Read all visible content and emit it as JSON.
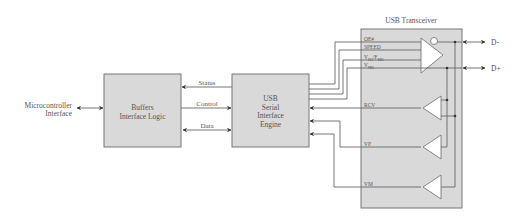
{
  "diagram": {
    "title": "USB Transceiver",
    "blocks": {
      "microcontroller": {
        "line1": "Microcontroller",
        "line2": "Interface"
      },
      "buffers": {
        "line1": "Buffers",
        "line2": "Interface Logic"
      },
      "sie": {
        "line1": "USB",
        "line2": "Serial",
        "line3": "Interface",
        "line4": "Engine"
      },
      "transceiver": {
        "label": "USB Transceiver"
      }
    },
    "bus_labels": {
      "status": "Status",
      "control": "Control",
      "data": "Data"
    },
    "transceiver_signals": {
      "oe": "OE#",
      "speed": "SPEED",
      "vpo_fmo_main": "V",
      "vpo_sub": "PO",
      "vpo_sep": "/F",
      "fmo_sub": "MO",
      "vmo_main": "V",
      "vmo_sub": "MO",
      "rcv": "RCV",
      "vp": "VP",
      "vm": "VM"
    },
    "outputs": {
      "d_minus": "D-",
      "d_plus": "D+"
    },
    "colors": {
      "block_fill": "#d9d9d9",
      "block_stroke": "#777777",
      "wire": "#666666",
      "text": "#555555"
    }
  }
}
